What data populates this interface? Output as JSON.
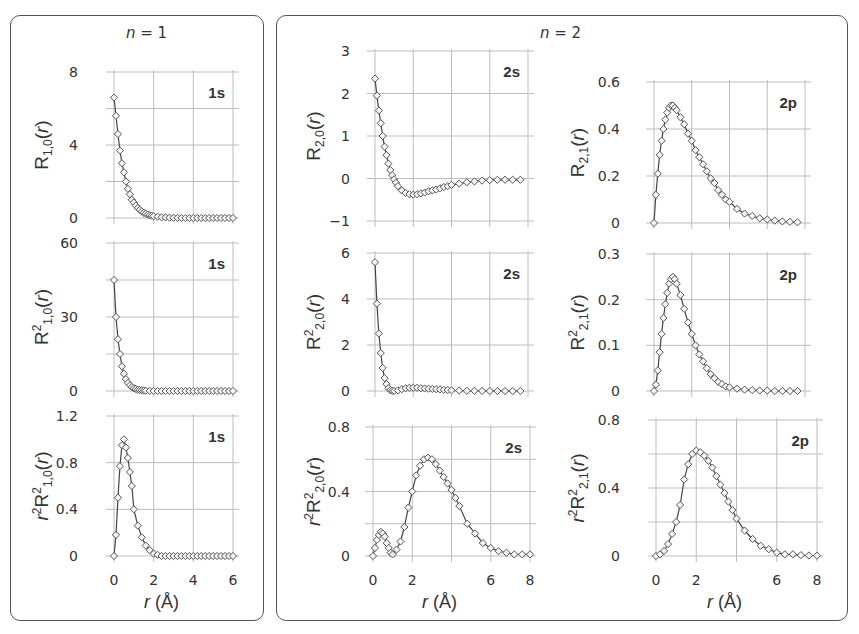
{
  "panels": {
    "n1_title_var": "n",
    "n1_title_eq": " = 1",
    "n2_title_var": "n",
    "n2_title_eq": " = 2"
  },
  "chart_data": [
    {
      "id": "R10",
      "type": "line",
      "orbital_label": "1s",
      "ylabel": "R1,0(r)",
      "ylabel_parts": {
        "main": "R",
        "sub": "1,0",
        "sup": "",
        "pre": ""
      },
      "xlabel": "",
      "xlim": [
        0,
        6
      ],
      "ylim": [
        0,
        8
      ],
      "yticks": [
        0,
        4,
        8
      ],
      "ygrid_step": 2,
      "xticks": [
        0,
        2,
        4,
        6
      ],
      "show_xtick_labels": false,
      "x": [
        0,
        0.1,
        0.2,
        0.3,
        0.4,
        0.5,
        0.6,
        0.7,
        0.8,
        0.9,
        1.0,
        1.1,
        1.2,
        1.3,
        1.4,
        1.5,
        1.6,
        1.7,
        1.8,
        1.9,
        2.0,
        2.2,
        2.4,
        2.6,
        2.8,
        3.0,
        3.2,
        3.4,
        3.6,
        3.8,
        4.0,
        4.2,
        4.4,
        4.6,
        4.8,
        5.0,
        5.2,
        5.4,
        5.6,
        5.8,
        6.0
      ],
      "y": [
        6.6,
        5.6,
        4.6,
        3.7,
        3.0,
        2.5,
        2.0,
        1.6,
        1.3,
        1.0,
        0.85,
        0.68,
        0.55,
        0.45,
        0.36,
        0.29,
        0.24,
        0.19,
        0.15,
        0.12,
        0.1,
        0.07,
        0.04,
        0.03,
        0.02,
        0.01,
        0.01,
        0.0,
        0.0,
        0.0,
        0.0,
        0.0,
        0.0,
        0.0,
        0.0,
        0.0,
        0.0,
        0.0,
        0.0,
        0.0,
        0.0
      ]
    },
    {
      "id": "R2_10",
      "type": "line",
      "orbital_label": "1s",
      "ylabel": "R²1,0(r)",
      "ylabel_parts": {
        "main": "R",
        "sub": "1,0",
        "sup": "2",
        "pre": ""
      },
      "xlabel": "",
      "xlim": [
        0,
        6
      ],
      "ylim": [
        0,
        60
      ],
      "yticks": [
        0,
        30,
        60
      ],
      "ygrid_step": 15,
      "xticks": [
        0,
        2,
        4,
        6
      ],
      "show_xtick_labels": false,
      "x": [
        0,
        0.1,
        0.2,
        0.3,
        0.4,
        0.5,
        0.6,
        0.7,
        0.8,
        0.9,
        1.0,
        1.1,
        1.2,
        1.3,
        1.4,
        1.5,
        1.6,
        1.8,
        2.0,
        2.2,
        2.4,
        2.6,
        2.8,
        3.0,
        3.2,
        3.4,
        3.6,
        3.8,
        4.0,
        4.2,
        4.4,
        4.6,
        4.8,
        5.0,
        5.2,
        5.4,
        5.6,
        5.8,
        6.0
      ],
      "y": [
        45,
        30,
        21,
        15,
        10,
        7,
        4.8,
        3.3,
        2.3,
        1.6,
        1.1,
        0.8,
        0.5,
        0.4,
        0.3,
        0.2,
        0.1,
        0.05,
        0.02,
        0.01,
        0,
        0,
        0,
        0,
        0,
        0,
        0,
        0,
        0,
        0,
        0,
        0,
        0,
        0,
        0,
        0,
        0,
        0,
        0
      ]
    },
    {
      "id": "r2R2_10",
      "type": "line",
      "orbital_label": "1s",
      "ylabel": "r²R²1,0(r)",
      "ylabel_parts": {
        "main": "R",
        "sub": "1,0",
        "sup": "2",
        "pre": "r2"
      },
      "xlabel": "r (Å)",
      "xlim": [
        0,
        6
      ],
      "ylim": [
        0,
        1.2
      ],
      "yticks": [
        0,
        0.4,
        0.8,
        1.2
      ],
      "ygrid_step": 0.4,
      "xticks": [
        0,
        2,
        4,
        6
      ],
      "show_xtick_labels": true,
      "x": [
        0,
        0.1,
        0.2,
        0.3,
        0.4,
        0.5,
        0.6,
        0.7,
        0.8,
        0.9,
        1.0,
        1.2,
        1.4,
        1.6,
        1.8,
        2.0,
        2.2,
        2.4,
        2.6,
        2.8,
        3.0,
        3.2,
        3.4,
        3.6,
        3.8,
        4.0,
        4.2,
        4.4,
        4.6,
        4.8,
        5.0,
        5.2,
        5.4,
        5.6,
        5.8,
        6.0
      ],
      "y": [
        0,
        0.18,
        0.5,
        0.77,
        0.95,
        1.0,
        0.93,
        0.84,
        0.72,
        0.6,
        0.4,
        0.26,
        0.16,
        0.09,
        0.05,
        0.02,
        0.01,
        0,
        0,
        0,
        0,
        0,
        0,
        0,
        0,
        0,
        0,
        0,
        0,
        0,
        0,
        0,
        0,
        0,
        0,
        0
      ]
    },
    {
      "id": "R20",
      "type": "line",
      "orbital_label": "2s",
      "ylabel": "R2,0(r)",
      "ylabel_parts": {
        "main": "R",
        "sub": "2,0",
        "sup": "",
        "pre": ""
      },
      "xlabel": "",
      "xlim": [
        0,
        8
      ],
      "ylim": [
        -1,
        3
      ],
      "yticks": [
        -1,
        0,
        1,
        2,
        3
      ],
      "ygrid_step": 1,
      "xticks": [
        0,
        2,
        4,
        6,
        8
      ],
      "show_xtick_labels": false,
      "x": [
        0,
        0.1,
        0.2,
        0.3,
        0.4,
        0.5,
        0.6,
        0.7,
        0.8,
        0.9,
        1.0,
        1.1,
        1.2,
        1.4,
        1.6,
        1.8,
        2.0,
        2.2,
        2.4,
        2.6,
        2.8,
        3.0,
        3.2,
        3.4,
        3.6,
        3.8,
        4.0,
        4.4,
        4.8,
        5.2,
        5.6,
        6.0,
        6.4,
        6.8,
        7.2,
        7.6
      ],
      "y": [
        2.35,
        1.95,
        1.6,
        1.3,
        1.0,
        0.75,
        0.55,
        0.35,
        0.2,
        0.08,
        -0.02,
        -0.1,
        -0.18,
        -0.28,
        -0.34,
        -0.37,
        -0.38,
        -0.37,
        -0.35,
        -0.33,
        -0.3,
        -0.28,
        -0.26,
        -0.23,
        -0.2,
        -0.18,
        -0.15,
        -0.12,
        -0.09,
        -0.07,
        -0.05,
        -0.04,
        -0.03,
        -0.03,
        -0.03,
        -0.03
      ]
    },
    {
      "id": "R2_20",
      "type": "line",
      "orbital_label": "2s",
      "ylabel": "R²2,0(r)",
      "ylabel_parts": {
        "main": "R",
        "sub": "2,0",
        "sup": "2",
        "pre": ""
      },
      "xlabel": "",
      "xlim": [
        0,
        8
      ],
      "ylim": [
        0,
        6
      ],
      "yticks": [
        0,
        2,
        4,
        6
      ],
      "ygrid_step": 2,
      "xticks": [
        0,
        2,
        4,
        6,
        8
      ],
      "show_xtick_labels": false,
      "x": [
        0,
        0.1,
        0.2,
        0.3,
        0.4,
        0.5,
        0.6,
        0.7,
        0.8,
        0.9,
        1.0,
        1.2,
        1.4,
        1.6,
        1.8,
        2.0,
        2.2,
        2.4,
        2.6,
        2.8,
        3.0,
        3.2,
        3.4,
        3.6,
        3.8,
        4.0,
        4.4,
        4.8,
        5.2,
        5.6,
        6.0,
        6.4,
        6.8,
        7.2,
        7.6
      ],
      "y": [
        5.6,
        3.8,
        2.5,
        1.65,
        1.0,
        0.56,
        0.3,
        0.12,
        0.04,
        0.01,
        0.0,
        0.03,
        0.08,
        0.12,
        0.14,
        0.14,
        0.14,
        0.12,
        0.11,
        0.1,
        0.09,
        0.08,
        0.07,
        0.05,
        0.04,
        0.03,
        0.02,
        0.01,
        0.01,
        0,
        0,
        0,
        0,
        0,
        0
      ]
    },
    {
      "id": "r2R2_20",
      "type": "line",
      "orbital_label": "2s",
      "ylabel": "r²R²2,0(r)",
      "ylabel_parts": {
        "main": "R",
        "sub": "2,0",
        "sup": "2",
        "pre": "r2"
      },
      "xlabel": "r (Å)",
      "xlim": [
        0,
        8
      ],
      "ylim": [
        0,
        0.8
      ],
      "yticks": [
        0,
        0.4,
        0.8
      ],
      "ygrid_step": 0.2,
      "xticks": [
        0,
        2,
        4,
        6,
        8
      ],
      "xtick_labels": [
        "0",
        "2",
        "",
        "6",
        "8"
      ],
      "show_xtick_labels": true,
      "x": [
        0,
        0.1,
        0.2,
        0.3,
        0.4,
        0.5,
        0.6,
        0.7,
        0.8,
        0.9,
        1.0,
        1.2,
        1.4,
        1.6,
        1.8,
        2.0,
        2.2,
        2.4,
        2.6,
        2.8,
        3.0,
        3.2,
        3.4,
        3.6,
        3.8,
        4.0,
        4.2,
        4.4,
        4.8,
        5.2,
        5.6,
        6.0,
        6.4,
        6.8,
        7.2,
        7.6,
        8.0
      ],
      "y": [
        0,
        0.05,
        0.1,
        0.13,
        0.15,
        0.14,
        0.12,
        0.08,
        0.05,
        0.02,
        0.01,
        0.04,
        0.09,
        0.18,
        0.3,
        0.4,
        0.5,
        0.56,
        0.6,
        0.61,
        0.6,
        0.57,
        0.53,
        0.49,
        0.45,
        0.41,
        0.36,
        0.31,
        0.2,
        0.14,
        0.08,
        0.05,
        0.03,
        0.02,
        0.01,
        0.01,
        0.01
      ]
    },
    {
      "id": "R21",
      "type": "line",
      "orbital_label": "2p",
      "ylabel": "R2,1(r)",
      "ylabel_parts": {
        "main": "R",
        "sub": "2,1",
        "sup": "",
        "pre": ""
      },
      "xlabel": "",
      "xlim": [
        0,
        8
      ],
      "ylim": [
        0,
        0.6
      ],
      "yticks": [
        0,
        0.2,
        0.4,
        0.6
      ],
      "ygrid_step": 0.2,
      "xticks": [
        0,
        2,
        4,
        6,
        8
      ],
      "show_xtick_labels": false,
      "x": [
        0,
        0.1,
        0.2,
        0.3,
        0.4,
        0.5,
        0.6,
        0.7,
        0.8,
        0.9,
        1.0,
        1.1,
        1.2,
        1.4,
        1.6,
        1.8,
        2.0,
        2.2,
        2.4,
        2.6,
        2.8,
        3.0,
        3.2,
        3.4,
        3.6,
        3.8,
        4.0,
        4.4,
        4.8,
        5.2,
        5.6,
        6.0,
        6.4,
        6.8,
        7.2,
        7.6
      ],
      "y": [
        0,
        0.12,
        0.21,
        0.29,
        0.35,
        0.4,
        0.44,
        0.47,
        0.49,
        0.5,
        0.5,
        0.49,
        0.48,
        0.45,
        0.42,
        0.38,
        0.35,
        0.31,
        0.28,
        0.25,
        0.22,
        0.19,
        0.17,
        0.14,
        0.12,
        0.1,
        0.09,
        0.06,
        0.04,
        0.03,
        0.02,
        0.015,
        0.01,
        0.007,
        0.005,
        0.003
      ]
    },
    {
      "id": "R2_21",
      "type": "line",
      "orbital_label": "2p",
      "ylabel": "R²2,1(r)",
      "ylabel_parts": {
        "main": "R",
        "sub": "2,1",
        "sup": "2",
        "pre": ""
      },
      "xlabel": "",
      "xlim": [
        0,
        8
      ],
      "ylim": [
        0,
        0.3
      ],
      "yticks": [
        0,
        0.1,
        0.2,
        0.3
      ],
      "ygrid_step": 0.1,
      "xticks": [
        0,
        2,
        4,
        6,
        8
      ],
      "show_xtick_labels": false,
      "x": [
        0,
        0.1,
        0.2,
        0.3,
        0.4,
        0.5,
        0.6,
        0.7,
        0.8,
        0.9,
        1.0,
        1.1,
        1.2,
        1.4,
        1.6,
        1.8,
        2.0,
        2.2,
        2.4,
        2.6,
        2.8,
        3.0,
        3.2,
        3.4,
        3.6,
        3.8,
        4.0,
        4.4,
        4.8,
        5.2,
        5.6,
        6.0,
        6.4,
        6.8,
        7.2,
        7.6
      ],
      "y": [
        0,
        0.014,
        0.045,
        0.085,
        0.125,
        0.16,
        0.19,
        0.215,
        0.235,
        0.245,
        0.25,
        0.245,
        0.235,
        0.21,
        0.18,
        0.15,
        0.125,
        0.1,
        0.08,
        0.065,
        0.05,
        0.037,
        0.028,
        0.02,
        0.015,
        0.01,
        0.008,
        0.005,
        0.003,
        0.002,
        0.001,
        0.001,
        0,
        0,
        0,
        0
      ]
    },
    {
      "id": "r2R2_21",
      "type": "line",
      "orbital_label": "2p",
      "ylabel": "r²R²2,1(r)",
      "ylabel_parts": {
        "main": "R",
        "sub": "2,1",
        "sup": "2",
        "pre": "r2"
      },
      "xlabel": "r (Å)",
      "xlim": [
        0,
        8
      ],
      "ylim": [
        0,
        0.8
      ],
      "yticks": [
        0,
        0.4,
        0.8
      ],
      "ygrid_step": 0.2,
      "xticks": [
        0,
        2,
        4,
        6,
        8
      ],
      "xtick_labels": [
        "0",
        "2",
        "",
        "6",
        "8"
      ],
      "show_xtick_labels": true,
      "x": [
        0,
        0.2,
        0.4,
        0.6,
        0.8,
        1.0,
        1.2,
        1.4,
        1.6,
        1.8,
        2.0,
        2.2,
        2.4,
        2.6,
        2.8,
        3.0,
        3.2,
        3.4,
        3.6,
        3.8,
        4.0,
        4.4,
        4.8,
        5.2,
        5.6,
        6.0,
        6.4,
        6.8,
        7.2,
        7.6,
        8.0
      ],
      "y": [
        0,
        0.01,
        0.03,
        0.07,
        0.13,
        0.2,
        0.3,
        0.45,
        0.54,
        0.6,
        0.62,
        0.61,
        0.59,
        0.56,
        0.52,
        0.47,
        0.42,
        0.37,
        0.32,
        0.27,
        0.22,
        0.15,
        0.1,
        0.06,
        0.04,
        0.02,
        0.01,
        0.01,
        0.005,
        0.003,
        0.002
      ]
    }
  ]
}
